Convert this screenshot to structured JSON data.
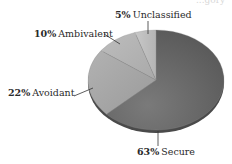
{
  "chart_data": {
    "type": "pie",
    "style": "3d-tilted",
    "title": "",
    "categories": [
      "Secure",
      "Avoidant",
      "Ambivalent",
      "Unclassified"
    ],
    "values": [
      63,
      22,
      10,
      5
    ],
    "unit": "%",
    "start_angle_deg": 0,
    "direction": "clockwise",
    "colors": [
      "#6b6b6b",
      "#a6a6a6",
      "#b5b5b5",
      "#c2c2c2"
    ],
    "labels": [
      {
        "pct": "63%",
        "name": "Secure"
      },
      {
        "pct": "22%",
        "name": "Avoidant"
      },
      {
        "pct": "10%",
        "name": "Ambivalent"
      },
      {
        "pct": "5%",
        "name": "Unclassified"
      }
    ],
    "legend": "none (inline labels with leader lines)"
  },
  "cut_off_text": "...gory"
}
